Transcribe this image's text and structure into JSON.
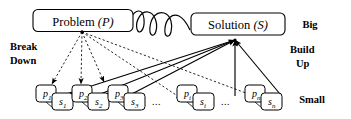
{
  "figure": {
    "type": "diagram",
    "nodes": {
      "problem": {
        "label": "Problem",
        "symbol": "(P)",
        "id": "problem-node"
      },
      "solution": {
        "label": "Solution",
        "symbol": "(S)",
        "id": "solution-node"
      }
    },
    "side_labels": {
      "top_right": "Big",
      "bottom_right": "Small",
      "left_line1": "Break",
      "left_line2": "Down",
      "right_line1": "Build",
      "right_line2": "Up"
    },
    "leaves": [
      {
        "p": "p",
        "p_sub": "1",
        "s": "s",
        "s_sub": "1"
      },
      {
        "p": "p",
        "p_sub": "2",
        "s": "s",
        "s_sub": "2"
      },
      {
        "p": "p",
        "p_sub": "3",
        "s": "s",
        "s_sub": "3"
      },
      {
        "p": "p",
        "p_sub": "i",
        "s": "s",
        "s_sub": "i"
      },
      {
        "p": "p",
        "p_sub": "n",
        "s": "s",
        "s_sub": "n"
      }
    ],
    "ellipses": [
      "...",
      "..."
    ],
    "edges": {
      "break_down_style": "dashed",
      "build_up_style": "solid",
      "linking_style": "wavy"
    },
    "colors": {
      "stroke": "#000000",
      "background": "#ffffff",
      "text": "#000000"
    }
  }
}
